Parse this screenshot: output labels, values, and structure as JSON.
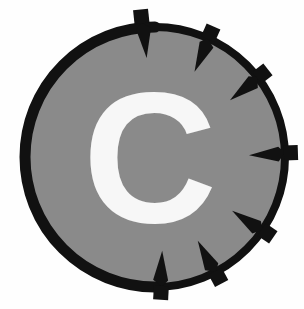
{
  "figure": {
    "letter": "C",
    "letter_color": "#f7f7f7",
    "disc_fill": "#8a8a8a",
    "disc_outline": "#111111",
    "arrow_color": "#111111",
    "background": "#fefefe",
    "canvas": {
      "width": 304,
      "height": 309
    },
    "circle": {
      "cx": 155,
      "cy": 157,
      "r": 132,
      "stroke_width": 8
    },
    "arrow_count": 7,
    "arrows": [
      {
        "name": "arrow-top",
        "angle_deg": -96,
        "direction": "inward"
      },
      {
        "name": "arrow-top-right",
        "angle_deg": -66,
        "direction": "inward"
      },
      {
        "name": "arrow-right-upper",
        "angle_deg": -38,
        "direction": "inward"
      },
      {
        "name": "arrow-right",
        "angle_deg": -2,
        "direction": "inward"
      },
      {
        "name": "arrow-right-lower",
        "angle_deg": 34,
        "direction": "inward"
      },
      {
        "name": "arrow-bottom-right",
        "angle_deg": 62,
        "direction": "inward"
      },
      {
        "name": "arrow-bottom",
        "angle_deg": 93,
        "direction": "inward"
      }
    ]
  }
}
